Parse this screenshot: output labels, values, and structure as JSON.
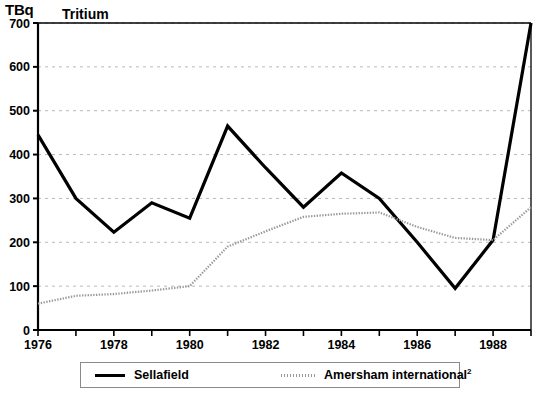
{
  "chart_data": {
    "type": "line",
    "title": "Tritium",
    "unit_label": "TBq",
    "xlabel": "",
    "ylabel": "",
    "ylim": [
      0,
      700
    ],
    "xlim": [
      1976,
      1989
    ],
    "ytick_labels": [
      "0",
      "100",
      "200",
      "300",
      "400",
      "500",
      "600",
      "700"
    ],
    "ytick_values": [
      0,
      100,
      200,
      300,
      400,
      500,
      600,
      700
    ],
    "xtick_labels": [
      "1976",
      "1978",
      "1980",
      "1982",
      "1984",
      "1986",
      "1988"
    ],
    "xtick_values": [
      1976,
      1978,
      1980,
      1982,
      1984,
      1986,
      1988
    ],
    "x_minor_ticks": [
      1977,
      1979,
      1981,
      1983,
      1985,
      1987,
      1989
    ],
    "grid": "horizontal-dashed",
    "legend_position": "bottom",
    "x": [
      1976,
      1977,
      1978,
      1979,
      1980,
      1981,
      1982,
      1983,
      1984,
      1985,
      1986,
      1987,
      1988,
      1989
    ],
    "series": [
      {
        "name": "Sellafield",
        "style": "solid-thick-black",
        "color": "#000000",
        "values": [
          445,
          300,
          223,
          290,
          255,
          465,
          370,
          280,
          358,
          300,
          200,
          95,
          205,
          700
        ]
      },
      {
        "name": "Amersham international ²",
        "label_text": "Amersham international",
        "label_superscript": "2",
        "style": "dotted-grey",
        "color": "#9a9a9a",
        "values": [
          60,
          78,
          82,
          90,
          100,
          190,
          225,
          258,
          265,
          268,
          235,
          210,
          205,
          280
        ]
      }
    ]
  },
  "legend": {
    "entries": [
      {
        "label": "Sellafield",
        "superscript": ""
      },
      {
        "label": "Amersham international",
        "superscript": "2"
      }
    ]
  }
}
